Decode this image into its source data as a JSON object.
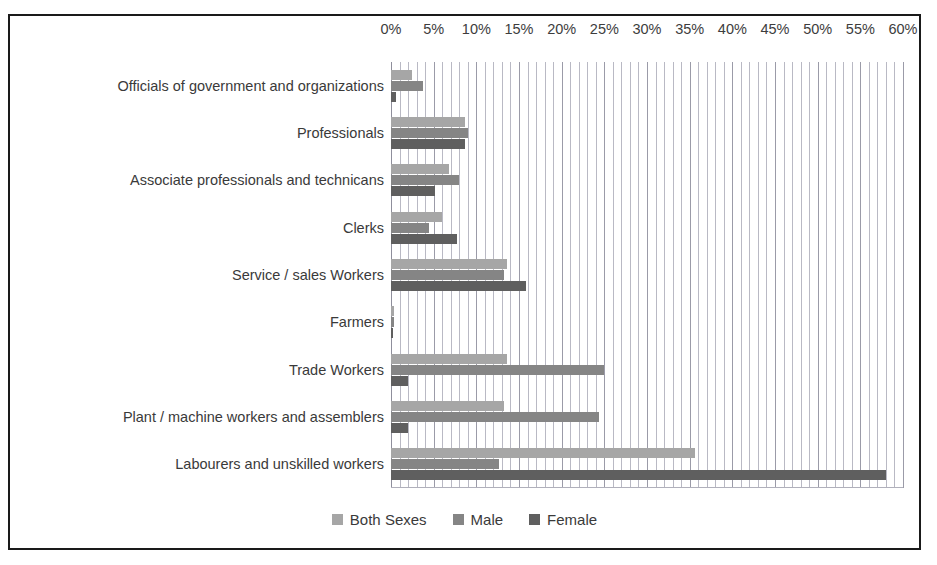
{
  "chart_data": {
    "type": "bar",
    "orientation": "horizontal",
    "title": "",
    "xlabel": "",
    "ylabel": "",
    "xlim": [
      0,
      60
    ],
    "xtick_step": 5,
    "grid": true,
    "legend_position": "bottom",
    "tick_labels": [
      "0%",
      "5%",
      "10%",
      "15%",
      "20%",
      "25%",
      "30%",
      "35%",
      "40%",
      "45%",
      "50%",
      "55%",
      "60%"
    ],
    "categories": [
      "Officials of government and organizations",
      "Professionals",
      "Associate professionals and technicans",
      "Clerks",
      "Service / sales Workers",
      "Farmers",
      "Trade Workers",
      "Plant / machine workers and assemblers",
      "Labourers and unskilled workers"
    ],
    "series": [
      {
        "name": "Both Sexes",
        "color": "#a6a6a6",
        "values": [
          2.5,
          8.7,
          6.8,
          6.0,
          13.6,
          0.3,
          13.6,
          13.2,
          35.6
        ]
      },
      {
        "name": "Male",
        "color": "#858585",
        "values": [
          3.8,
          9.0,
          8.0,
          4.4,
          13.2,
          0.4,
          25.0,
          24.4,
          12.6
        ]
      },
      {
        "name": "Female",
        "color": "#5f5f5f",
        "values": [
          0.6,
          8.7,
          5.1,
          7.7,
          15.8,
          0.2,
          2.0,
          2.0,
          58.0
        ]
      }
    ]
  },
  "legend": {
    "items": [
      {
        "label": "Both Sexes",
        "key": "both"
      },
      {
        "label": "Male",
        "key": "male"
      },
      {
        "label": "Female",
        "key": "female"
      }
    ]
  }
}
